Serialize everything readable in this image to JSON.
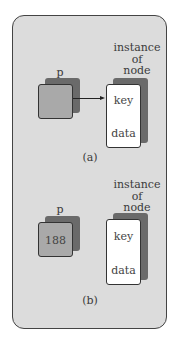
{
  "figure": {
    "panel_a": {
      "pointer_label": "p",
      "pointer_value": "",
      "node_label_lines": [
        "instance",
        "of",
        "node"
      ],
      "node_fields": [
        "key",
        "data"
      ],
      "caption": "(a)",
      "has_arrow": true
    },
    "panel_b": {
      "pointer_label": "p",
      "pointer_value": "188",
      "node_label_lines": [
        "instance",
        "of",
        "node"
      ],
      "node_fields": [
        "key",
        "data"
      ],
      "caption": "(b)",
      "has_arrow": false
    }
  },
  "colors": {
    "frame_fill": "#dcdcdc",
    "pointer_fill": "#a9a9a9",
    "node_fill": "#ffffff",
    "shadow": "#6a6a6a"
  }
}
